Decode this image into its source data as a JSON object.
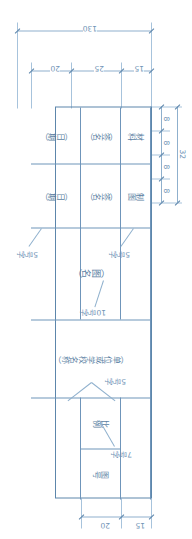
{
  "drawing": {
    "title": "标题栏 (Title Block)",
    "type": "engineering-title-block",
    "units": "mm",
    "overall": {
      "length": "130",
      "width": "32"
    },
    "top_dimension_chain": {
      "total": "32",
      "segments": [
        "8",
        "8",
        "8",
        "8"
      ]
    },
    "left_dimension_chain": {
      "total": "130",
      "segments": [
        "15",
        "25",
        "20"
      ]
    },
    "right_dimension_chain": {
      "segments": [
        "15",
        "20"
      ]
    },
    "cells": {
      "material": "材料",
      "drawn_by": "制图",
      "signature_1": "（签名）",
      "signature_2": "（签名）",
      "date_1": "（日期）",
      "date_2": "（日期）",
      "drawing_name": "（图名）",
      "org_name": "（单位或学校名称）",
      "scale": "比例",
      "drawing_no": "图号"
    },
    "notes": {
      "font_5_a": "5号字",
      "font_5_b": "5号字",
      "font_5_c": "5号字",
      "font_10": "10号字",
      "font_7": "7号字"
    },
    "colors": {
      "line": "#5d86ab",
      "grid": "#6f95ba",
      "dim": "#8fb0cd",
      "text": "#6f93b6",
      "background": "#ffffff"
    }
  }
}
